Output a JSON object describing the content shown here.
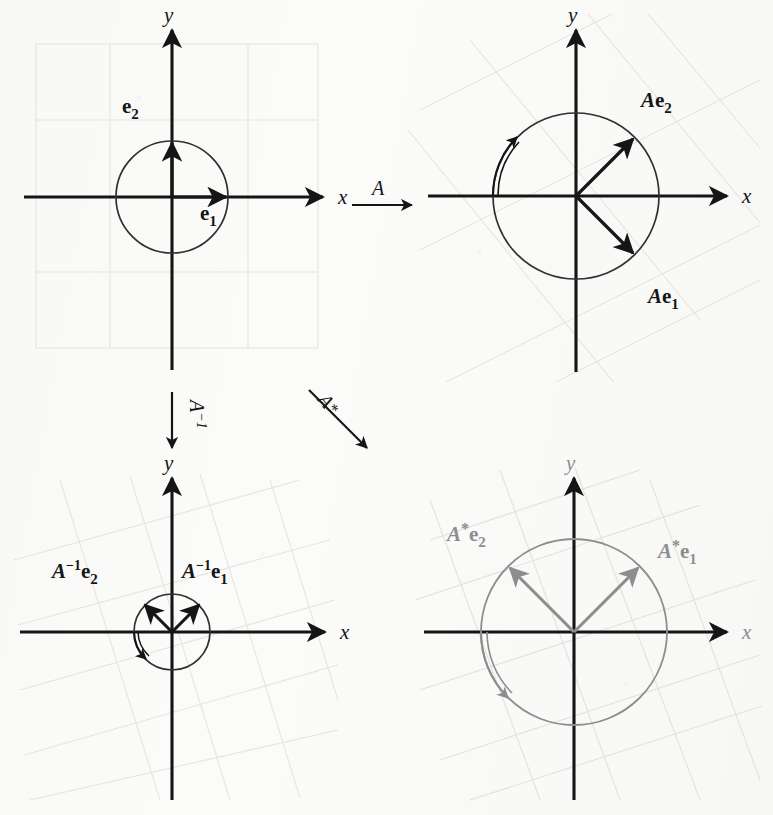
{
  "figure": {
    "axis_labels": {
      "x": "x",
      "y": "y"
    },
    "maps": [
      {
        "name": "map-A",
        "label": "A",
        "direction": "right",
        "from": "panel-identity",
        "to": "panel-A"
      },
      {
        "name": "map-A-inverse",
        "label": "A−1",
        "display": "A",
        "exponent": "−1",
        "direction": "down",
        "from": "panel-identity",
        "to": "panel-A-inverse"
      },
      {
        "name": "map-A-adjoint",
        "label": "A*",
        "display": "A",
        "star": "*",
        "direction": "down-right",
        "from": "panel-identity",
        "to": "panel-A-adjoint"
      }
    ],
    "panels": [
      {
        "name": "panel-identity",
        "position": "top-left",
        "origin": [
          172,
          197
        ],
        "radius": 56,
        "grid": "axis-aligned",
        "color": "#151515",
        "vectors": [
          {
            "name": "vector-e1",
            "label": "e",
            "subscript": "1",
            "angle_deg": 0,
            "length": 56,
            "label_pos": [
              200,
              218
            ]
          },
          {
            "name": "vector-e2",
            "label": "e",
            "subscript": "2",
            "angle_deg": 90,
            "length": 56,
            "label_pos": [
              129,
              109
            ]
          }
        ],
        "arc": null
      },
      {
        "name": "panel-A",
        "position": "top-right",
        "origin": [
          576,
          196
        ],
        "radius": 83,
        "grid": "rotated-45",
        "color": "#151515",
        "vectors": [
          {
            "name": "vector-Ae1",
            "label": "e",
            "prefix": "A",
            "subscript": "1",
            "angle_deg": -45,
            "length": 83,
            "label_pos": [
              652,
              302
            ]
          },
          {
            "name": "vector-Ae2",
            "label": "e",
            "prefix": "A",
            "subscript": "2",
            "angle_deg": 45,
            "length": 83,
            "label_pos": [
              644,
              105
            ]
          }
        ],
        "arc": {
          "name": "rotation-arc-A",
          "start_deg": 180,
          "end_deg": 135,
          "direction": "counterclockwise",
          "radius": 83
        }
      },
      {
        "name": "panel-A-inverse",
        "position": "bottom-left",
        "origin": [
          172,
          632
        ],
        "radius": 38,
        "grid": "rotated-45",
        "color": "#151515",
        "vectors": [
          {
            "name": "vector-Ainv-e1",
            "label": "e",
            "prefix": "A",
            "exponent": "−1",
            "subscript": "1",
            "angle_deg": 45,
            "length": 38,
            "label_pos": [
              186,
              572
            ]
          },
          {
            "name": "vector-Ainv-e2",
            "label": "e",
            "prefix": "A",
            "exponent": "−1",
            "subscript": "2",
            "angle_deg": 135,
            "length": 38,
            "label_pos": [
              55,
              572
            ]
          }
        ],
        "arc": {
          "name": "rotation-arc-A-inverse",
          "start_deg": 180,
          "end_deg": 225,
          "direction": "clockwise",
          "radius": 38
        }
      },
      {
        "name": "panel-A-adjoint",
        "position": "bottom-right",
        "origin": [
          574,
          632
        ],
        "radius": 93,
        "grid": "rotated-45",
        "color": "#8d8d8d",
        "vectors": [
          {
            "name": "vector-Astar-e1",
            "label": "e",
            "prefix": "A",
            "star": "*",
            "subscript": "1",
            "angle_deg": 45,
            "length": 93,
            "label_pos": [
              663,
              551
            ]
          },
          {
            "name": "vector-Astar-e2",
            "label": "e",
            "prefix": "A",
            "star": "*",
            "subscript": "2",
            "angle_deg": 135,
            "length": 93,
            "label_pos": [
              450,
              535
            ]
          }
        ],
        "arc": {
          "name": "rotation-arc-A-adjoint",
          "start_deg": 180,
          "end_deg": 225,
          "direction": "clockwise",
          "radius": 93
        }
      }
    ],
    "colors": {
      "ink": "#151515",
      "grey_ink": "#8d8d8d",
      "grid_faint": "#e4e2de",
      "paper": "#fbfbfa"
    }
  }
}
